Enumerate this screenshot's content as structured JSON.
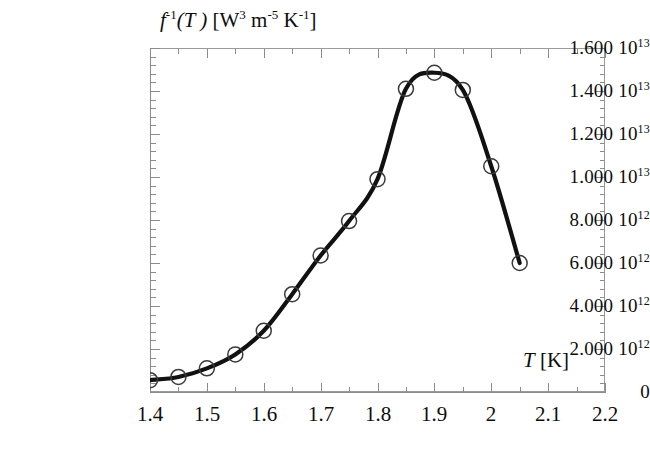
{
  "chart_data": {
    "type": "line",
    "title": "",
    "subtitle": "",
    "xlabel": "T [K]",
    "ylabel": "f -1(T ) [W3 m-5 K-1]",
    "xlim": [
      1.4,
      2.2
    ],
    "ylim": [
      0,
      16000000000000.0
    ],
    "grid": false,
    "legend": null,
    "marker": "open-circle",
    "x": [
      1.4,
      1.45,
      1.5,
      1.55,
      1.6,
      1.65,
      1.7,
      1.75,
      1.8,
      1.85,
      1.9,
      1.95,
      2.0,
      2.05
    ],
    "values": [
      550000000000.0,
      700000000000.0,
      1100000000000.0,
      1750000000000.0,
      2850000000000.0,
      4550000000000.0,
      6350000000000.0,
      7950000000000.0,
      9900000000000.0,
      14100000000000.0,
      14850000000000.0,
      14050000000000.0,
      10500000000000.0,
      6000000000000.0
    ],
    "series": [
      {
        "name": "f^-1(T)",
        "values": [
          550000000000.0,
          700000000000.0,
          1100000000000.0,
          1750000000000.0,
          2850000000000.0,
          4550000000000.0,
          6350000000000.0,
          7950000000000.0,
          9900000000000.0,
          14100000000000.0,
          14850000000000.0,
          14050000000000.0,
          10500000000000.0,
          6000000000000.0
        ]
      }
    ],
    "x_tick_labels": [
      "1.4",
      "1.5",
      "1.6",
      "1.7",
      "1.8",
      "1.9",
      "2",
      "2.1",
      "2.2"
    ],
    "x_tick_values": [
      1.4,
      1.5,
      1.6,
      1.7,
      1.8,
      1.9,
      2.0,
      2.1,
      2.2
    ],
    "y_tick_values": [
      0,
      2000000000000.0,
      4000000000000.0,
      6000000000000.0,
      8000000000000.0,
      10000000000000.0,
      12000000000000.0,
      14000000000000.0,
      16000000000000.0
    ],
    "y_minor_per_major": 5,
    "x_minor_per_major": 2,
    "curve_color": "#111111",
    "marker_color": "#3a3a3a",
    "axis_color": "#8c8c8c",
    "background_color": "#ffffff"
  },
  "axes": {
    "y_title": {
      "fn": "f",
      "fn_exp": "-1",
      "fn_arg": "(T )",
      "unit_open": "[W",
      "unit_w_exp": "3",
      "unit_m": " m",
      "unit_m_exp": "-5",
      "unit_k": " K",
      "unit_k_exp": "-1",
      "unit_close": "]"
    },
    "x_title": {
      "symbol": "T",
      "unit": " [K]"
    },
    "y_tick_labels": [
      {
        "mantissa": "0",
        "base": "",
        "exp": ""
      },
      {
        "mantissa": "2.000 ",
        "base": "10",
        "exp": "12"
      },
      {
        "mantissa": "4.000 ",
        "base": "10",
        "exp": "12"
      },
      {
        "mantissa": "6.000 ",
        "base": "10",
        "exp": "12"
      },
      {
        "mantissa": "8.000 ",
        "base": "10",
        "exp": "12"
      },
      {
        "mantissa": "1.000 ",
        "base": "10",
        "exp": "13"
      },
      {
        "mantissa": "1.200 ",
        "base": "10",
        "exp": "13"
      },
      {
        "mantissa": "1.400 ",
        "base": "10",
        "exp": "13"
      },
      {
        "mantissa": "1.600 ",
        "base": "10",
        "exp": "13"
      }
    ],
    "x_tick_labels": [
      "1.4",
      "1.5",
      "1.6",
      "1.7",
      "1.8",
      "1.9",
      "2",
      "2.1",
      "2.2"
    ]
  }
}
